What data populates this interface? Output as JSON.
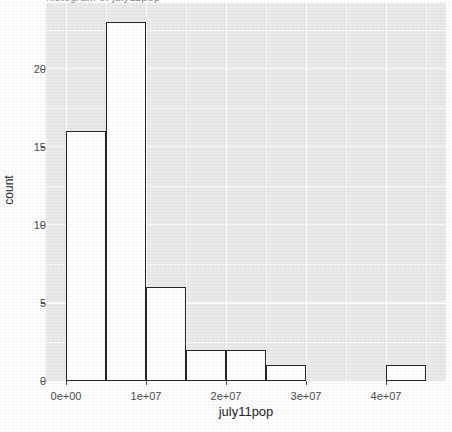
{
  "chart_data": {
    "type": "bar",
    "title": "",
    "xlabel": "july11pop",
    "ylabel": "count",
    "xlim": [
      -2500000,
      47500000
    ],
    "ylim": [
      0,
      24.2
    ],
    "grid": true,
    "legend": "none",
    "bin_width": 5000000,
    "bin_starts": [
      0,
      5000000,
      10000000,
      15000000,
      20000000,
      25000000,
      30000000,
      35000000,
      40000000
    ],
    "categories": [
      "0–5e+06",
      "5e+06–1e+07",
      "1e+07–1.5e+07",
      "1.5e+07–2e+07",
      "2e+07–2.5e+07",
      "2.5e+07–3e+07",
      "3e+07–3.5e+07",
      "3.5e+07–4e+07",
      "4e+07–4.5e+07"
    ],
    "values": [
      16,
      23,
      6,
      2,
      2,
      1,
      0,
      0,
      1
    ],
    "bar_fill": "#ffffff",
    "bar_stroke": "#262626",
    "panel_background": "#ebebeb",
    "grid_color": "#ffffff",
    "x_ticks": [
      {
        "value": 0,
        "label": "0e+00"
      },
      {
        "value": 10000000,
        "label": "1e+07"
      },
      {
        "value": 20000000,
        "label": "2e+07"
      },
      {
        "value": 30000000,
        "label": "3e+07"
      },
      {
        "value": 40000000,
        "label": "4e+07"
      }
    ],
    "y_ticks": [
      {
        "value": 0,
        "label": "0"
      },
      {
        "value": 5,
        "label": "5"
      },
      {
        "value": 10,
        "label": "10"
      },
      {
        "value": 15,
        "label": "15"
      },
      {
        "value": 20,
        "label": "20"
      }
    ],
    "y_minor_ticks": [
      2.5,
      7.5,
      12.5,
      17.5,
      22.5
    ],
    "x_minor_ticks": [
      5000000,
      15000000,
      25000000,
      35000000,
      45000000
    ]
  },
  "axes": {
    "x_title": "july11pop",
    "y_title": "count"
  },
  "header": {
    "title_fragment": "histogram of july11pop"
  }
}
